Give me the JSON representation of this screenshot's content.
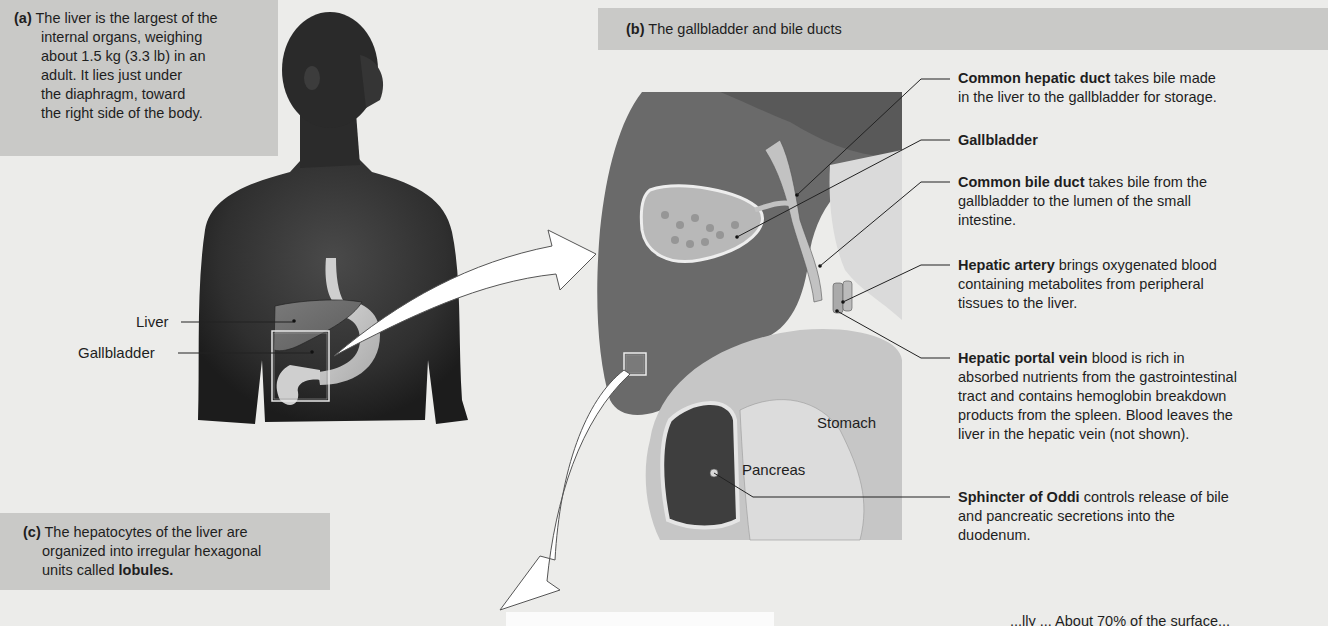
{
  "panels": {
    "a": {
      "tag": "(a)",
      "lines": [
        "The liver is the largest of the",
        "internal organs, weighing",
        "about 1.5 kg (3.3 lb) in an",
        "adult. It lies just under",
        "the diaphragm, toward",
        "the right side of the body."
      ]
    },
    "b": {
      "tag": "(b)",
      "title": "The gallbladder and bile ducts"
    },
    "c": {
      "tag": "(c)",
      "lines": [
        "The hepatocytes of the liver are",
        "organized into irregular hexagonal",
        "units called "
      ],
      "bold_term": "lobules."
    }
  },
  "figure_labels": {
    "liver": "Liver",
    "gallbladder": "Gallbladder",
    "stomach": "Stomach",
    "pancreas": "Pancreas"
  },
  "descriptions": [
    {
      "term": "Common hepatic duct",
      "lines": [
        " takes bile made",
        "in the liver to the gallbladder for storage."
      ]
    },
    {
      "term": "Gallbladder",
      "lines": [
        ""
      ]
    },
    {
      "term": "Common bile duct",
      "lines": [
        " takes bile from the",
        "gallbladder to the lumen of the small",
        "intestine."
      ]
    },
    {
      "term": "Hepatic artery",
      "lines": [
        " brings oxygenated blood",
        "containing metabolites from peripheral",
        "tissues to the liver."
      ]
    },
    {
      "term": "Hepatic portal vein",
      "lines": [
        " blood is rich in",
        "absorbed nutrients from the gastrointestinal",
        "tract and contains hemoglobin breakdown",
        "products from the spleen. Blood leaves the",
        "liver in the hepatic vein (not shown)."
      ]
    },
    {
      "term": "Sphincter of Oddi",
      "lines": [
        " controls release of bile",
        "and pancreatic secretions into the",
        "duodenum."
      ]
    }
  ],
  "bottom_cutoff_text": "...lly ... About 70% of the surface..."
}
